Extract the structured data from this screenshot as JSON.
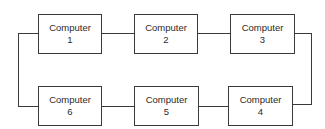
{
  "diagram": {
    "type": "ring-network",
    "line_color": "#3a3a3a",
    "nodes": [
      {
        "label": "Computer",
        "number": "1"
      },
      {
        "label": "Computer",
        "number": "2"
      },
      {
        "label": "Computer",
        "number": "3"
      },
      {
        "label": "Computer",
        "number": "4"
      },
      {
        "label": "Computer",
        "number": "5"
      },
      {
        "label": "Computer",
        "number": "6"
      }
    ],
    "connections": [
      [
        "1",
        "2"
      ],
      [
        "2",
        "3"
      ],
      [
        "3",
        "4"
      ],
      [
        "4",
        "5"
      ],
      [
        "5",
        "6"
      ],
      [
        "6",
        "1"
      ]
    ]
  }
}
